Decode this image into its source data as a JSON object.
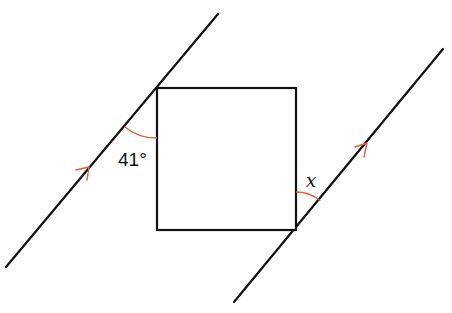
{
  "diagram": {
    "labels": {
      "given_angle": "41°",
      "unknown_angle": "x"
    },
    "colors": {
      "lines": "#111111",
      "angle_arcs": "#e0603a",
      "parallel_arrows": "#e0603a"
    },
    "shapes": {
      "square": {
        "x1": 157,
        "y1": 88,
        "x2": 296,
        "y2": 230
      },
      "left_parallel_line": {
        "from": [
          6,
          267
        ],
        "to": [
          218,
          14
        ]
      },
      "right_parallel_line": {
        "from": [
          234,
          302
        ],
        "to": [
          443,
          49
        ]
      }
    }
  }
}
